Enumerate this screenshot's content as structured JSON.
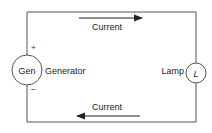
{
  "diagram": {
    "top_current_label": "Current",
    "bottom_current_label": "Current",
    "generator": {
      "symbol": "Gen",
      "label": "Generator",
      "plus": "+",
      "minus": "−"
    },
    "lamp": {
      "symbol": "L",
      "label": "Lamp"
    },
    "colors": {
      "line": "#555555",
      "text": "#222222"
    }
  }
}
